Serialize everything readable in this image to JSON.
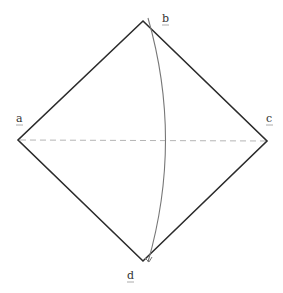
{
  "diagram": {
    "type": "rhombus-with-arc",
    "vertices": [
      {
        "id": "b",
        "label": "b",
        "x": 143,
        "y": 21
      },
      {
        "id": "a",
        "label": "a",
        "x": 18,
        "y": 140
      },
      {
        "id": "c",
        "label": "c",
        "x": 267,
        "y": 141
      },
      {
        "id": "d",
        "label": "d",
        "x": 143,
        "y": 261
      }
    ],
    "labels": {
      "a": "a",
      "b": "b",
      "c": "c",
      "d": "d"
    },
    "diagonal": {
      "from": "a",
      "to": "c",
      "style": "dashed"
    },
    "arc": {
      "from": "b",
      "to": "d",
      "description": "curved arc from top vertex to bottom vertex bulging right"
    },
    "colors": {
      "edge": "#2b2b2b",
      "diagonal": "#b5b5b5",
      "arc": "#777777",
      "background": "#ffffff"
    }
  }
}
